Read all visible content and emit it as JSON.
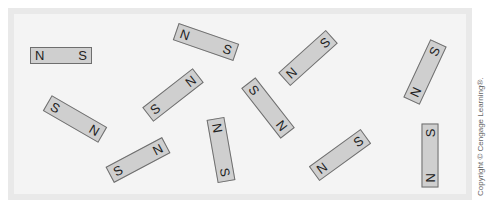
{
  "figure": {
    "magnet_fill": "#cfcfcf",
    "magnet_border": "#6e6e6e",
    "frame_color": "#e9e9e9",
    "frame_inner_color": "#f4f4f4"
  },
  "magnets": [
    {
      "id": 1,
      "left_label": "N",
      "right_label": "S",
      "cx": 61,
      "cy": 55,
      "w": 62,
      "h": 17,
      "angle": 0
    },
    {
      "id": 2,
      "left_label": "N",
      "right_label": "S",
      "cx": 206,
      "cy": 42,
      "w": 64,
      "h": 18,
      "angle": 19
    },
    {
      "id": 3,
      "left_label": "S",
      "right_label": "N",
      "cx": 173,
      "cy": 95,
      "w": 64,
      "h": 18,
      "angle": -38
    },
    {
      "id": 4,
      "left_label": "S",
      "right_label": "N",
      "cx": 268,
      "cy": 108,
      "w": 64,
      "h": 18,
      "angle": 52
    },
    {
      "id": 5,
      "left_label": "N",
      "right_label": "S",
      "cx": 308,
      "cy": 58,
      "w": 64,
      "h": 18,
      "angle": -42
    },
    {
      "id": 6,
      "left_label": "N",
      "right_label": "S",
      "cx": 425,
      "cy": 72,
      "w": 64,
      "h": 18,
      "angle": -65
    },
    {
      "id": 7,
      "left_label": "S",
      "right_label": "N",
      "cx": 75,
      "cy": 119,
      "w": 64,
      "h": 18,
      "angle": 30
    },
    {
      "id": 8,
      "left_label": "S",
      "right_label": "N",
      "cx": 138,
      "cy": 160,
      "w": 64,
      "h": 18,
      "angle": -28
    },
    {
      "id": 9,
      "left_label": "N",
      "right_label": "S",
      "cx": 221,
      "cy": 150,
      "w": 64,
      "h": 18,
      "angle": 80
    },
    {
      "id": 10,
      "left_label": "N",
      "right_label": "S",
      "cx": 340,
      "cy": 155,
      "w": 64,
      "h": 18,
      "angle": -36
    },
    {
      "id": 11,
      "left_label": "N",
      "right_label": "S",
      "cx": 430,
      "cy": 155,
      "w": 64,
      "h": 17,
      "angle": -90
    }
  ],
  "copyright": "Copyright © Cengage Learning®."
}
